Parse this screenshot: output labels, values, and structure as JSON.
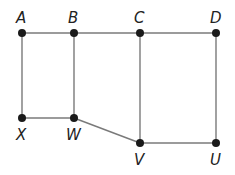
{
  "diagram": {
    "type": "graph",
    "nodes": [
      {
        "id": "A",
        "label": "A",
        "x": 22,
        "y": 33,
        "label_pos": "above"
      },
      {
        "id": "B",
        "label": "B",
        "x": 74,
        "y": 33,
        "label_pos": "above"
      },
      {
        "id": "C",
        "label": "C",
        "x": 140,
        "y": 33,
        "label_pos": "above"
      },
      {
        "id": "D",
        "label": "D",
        "x": 216,
        "y": 33,
        "label_pos": "above"
      },
      {
        "id": "X",
        "label": "X",
        "x": 22,
        "y": 118,
        "label_pos": "below"
      },
      {
        "id": "W",
        "label": "W",
        "x": 74,
        "y": 118,
        "label_pos": "below"
      },
      {
        "id": "V",
        "label": "V",
        "x": 140,
        "y": 143,
        "label_pos": "below"
      },
      {
        "id": "U",
        "label": "U",
        "x": 216,
        "y": 143,
        "label_pos": "below"
      }
    ],
    "edges": [
      [
        "A",
        "B"
      ],
      [
        "B",
        "C"
      ],
      [
        "C",
        "D"
      ],
      [
        "A",
        "X"
      ],
      [
        "B",
        "W"
      ],
      [
        "X",
        "W"
      ],
      [
        "W",
        "V"
      ],
      [
        "C",
        "V"
      ],
      [
        "V",
        "U"
      ],
      [
        "D",
        "U"
      ]
    ],
    "colors": {
      "edge": "#7a7a7a",
      "node": "#1a1a1a",
      "label": "#222222"
    }
  }
}
